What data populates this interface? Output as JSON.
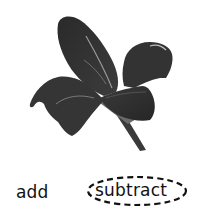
{
  "image": {
    "subject": "flower-photo",
    "style": "grayscale",
    "colors": {
      "petal_dark": "#2b2b2b",
      "petal_mid": "#4a4a4a",
      "vein": "#8a8a8a",
      "background": "#ffffff"
    }
  },
  "choices": {
    "options": [
      {
        "label": "add",
        "selected": false
      },
      {
        "label": "subtract",
        "selected": true
      }
    ],
    "selection_marker": "dashed-ellipse",
    "marker_color": "#111111"
  }
}
